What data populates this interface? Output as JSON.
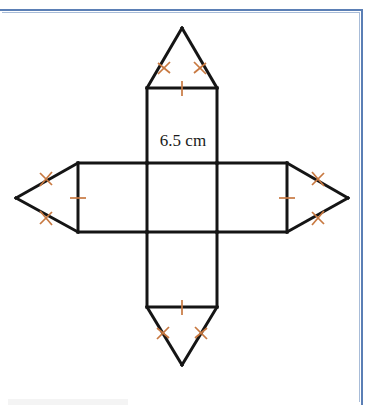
{
  "page": {
    "background_color": "#ffffff",
    "border_color": "#5b7fb5",
    "border_color_light": "#a8bcd8"
  },
  "figure": {
    "name": "net-of-solid",
    "stroke_color": "#151515",
    "stroke_width": 3,
    "tick_color": "#c87941",
    "fill_color": "#ffffff",
    "label": {
      "text": "6.5 cm",
      "value": 6.5,
      "unit": "cm"
    },
    "geometry": {
      "square": {
        "x": 147,
        "y": 163,
        "width": 70,
        "height": 69
      },
      "rect_top": {
        "x": 147,
        "y": 88,
        "width": 70,
        "height": 75
      },
      "rect_bottom": {
        "x": 147,
        "y": 232,
        "width": 70,
        "height": 75
      },
      "rect_left": {
        "x": 78,
        "y": 163,
        "width": 69,
        "height": 69
      },
      "rect_right": {
        "x": 217,
        "y": 163,
        "width": 70,
        "height": 69
      },
      "triangle_top": {
        "apex_x": 182,
        "apex_y": 28
      },
      "triangle_bottom": {
        "apex_x": 182,
        "apex_y": 365
      },
      "triangle_left": {
        "apex_x": 16,
        "apex_y": 198
      },
      "triangle_right": {
        "apex_x": 348,
        "apex_y": 198
      }
    },
    "marks": {
      "single_tick_edges": [
        "top-rectangle-outer-edge",
        "bottom-rectangle-outer-edge",
        "left-rectangle-outer-edge",
        "right-rectangle-outer-edge"
      ],
      "double_tick_edges": [
        "top-triangle-left-side",
        "top-triangle-right-side",
        "bottom-triangle-left-side",
        "bottom-triangle-right-side",
        "left-triangle-upper-side",
        "left-triangle-lower-side",
        "right-triangle-upper-side",
        "right-triangle-lower-side"
      ]
    }
  }
}
